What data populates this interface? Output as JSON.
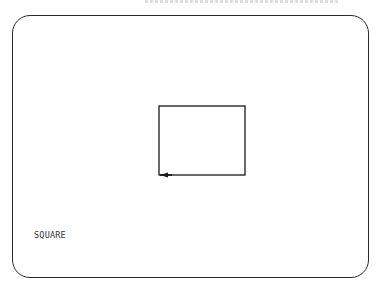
{
  "screen": {
    "label": "SQUARE"
  },
  "drawing": {
    "shape": "square",
    "turtle": {
      "heading": "left",
      "position": "bottom-left-corner"
    }
  },
  "colors": {
    "ink": "#2a2a2a",
    "background": "#ffffff"
  }
}
